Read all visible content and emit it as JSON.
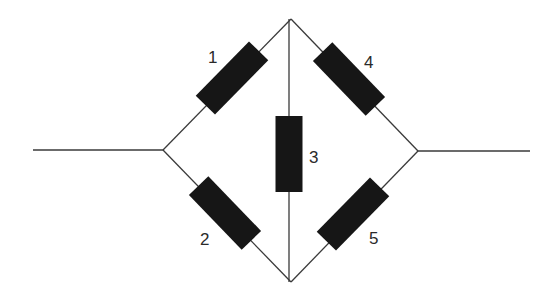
{
  "diagram": {
    "title": "",
    "type": "resistor bridge network (Wheatstone-type)",
    "nodes": {
      "left_terminal": {
        "x": 33,
        "y": 150
      },
      "left": {
        "x": 163,
        "y": 150
      },
      "top": {
        "x": 291,
        "y": 19
      },
      "bottom": {
        "x": 291,
        "y": 282
      },
      "right": {
        "x": 418,
        "y": 151
      },
      "right_terminal": {
        "x": 530,
        "y": 151
      }
    },
    "resistors": [
      {
        "label": "1",
        "from": "left",
        "to": "top",
        "cx": 232,
        "cy": 78,
        "angle": -45.5,
        "len": 76,
        "w": 27,
        "label_x": 208,
        "label_y": 63
      },
      {
        "label": "2",
        "from": "left",
        "to": "bottom",
        "cx": 225,
        "cy": 213,
        "angle": 46,
        "len": 76,
        "w": 27,
        "label_x": 200,
        "label_y": 245
      },
      {
        "label": "3",
        "from": "top",
        "to": "bottom",
        "cx": 289,
        "cy": 154,
        "angle": 90,
        "len": 76,
        "w": 27,
        "label_x": 309,
        "label_y": 163
      },
      {
        "label": "4",
        "from": "top",
        "to": "right",
        "cx": 349,
        "cy": 79,
        "angle": 46,
        "len": 76,
        "w": 27,
        "label_x": 364,
        "label_y": 68
      },
      {
        "label": "5",
        "from": "bottom",
        "to": "right",
        "cx": 353,
        "cy": 214,
        "angle": -45.5,
        "len": 76,
        "w": 27,
        "label_x": 369,
        "label_y": 244
      }
    ]
  }
}
